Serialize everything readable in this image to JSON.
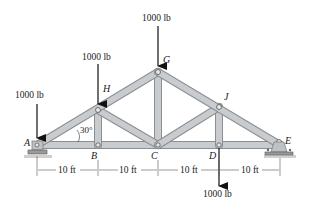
{
  "diagram": {
    "type": "roof truss",
    "joints": [
      {
        "id": "A",
        "label": "A",
        "x": 37,
        "y": 145
      },
      {
        "id": "B",
        "label": "B",
        "x": 98,
        "y": 145
      },
      {
        "id": "C",
        "label": "C",
        "x": 158,
        "y": 145
      },
      {
        "id": "D",
        "label": "D",
        "x": 219,
        "y": 145
      },
      {
        "id": "E",
        "label": "E",
        "x": 280,
        "y": 145
      },
      {
        "id": "H",
        "label": "H",
        "x": 98,
        "y": 110
      },
      {
        "id": "G",
        "label": "G",
        "x": 158,
        "y": 72
      },
      {
        "id": "J",
        "label": "J",
        "x": 219,
        "y": 107
      }
    ],
    "members": [
      [
        "A",
        "B"
      ],
      [
        "B",
        "C"
      ],
      [
        "C",
        "D"
      ],
      [
        "D",
        "E"
      ],
      [
        "A",
        "H"
      ],
      [
        "H",
        "G"
      ],
      [
        "G",
        "J"
      ],
      [
        "J",
        "E"
      ],
      [
        "B",
        "H"
      ],
      [
        "H",
        "C"
      ],
      [
        "C",
        "G"
      ],
      [
        "C",
        "J"
      ],
      [
        "J",
        "D"
      ]
    ],
    "loads": [
      {
        "at": "A",
        "label": "1000 lb",
        "direction": "down"
      },
      {
        "at": "H",
        "label": "1000 lb",
        "direction": "down"
      },
      {
        "at": "G",
        "label": "1000 lb",
        "direction": "down"
      },
      {
        "at": "D",
        "label": "1000 lb",
        "direction": "down"
      }
    ],
    "angle": {
      "at": "A",
      "label": "30°"
    },
    "dimensions": [
      "10 ft",
      "10 ft",
      "10 ft",
      "10 ft"
    ],
    "supports": [
      {
        "at": "A",
        "type": "pin"
      },
      {
        "at": "E",
        "type": "rocker"
      }
    ],
    "colors": {
      "member_fill": "#c9cccf",
      "member_edge": "#8a8f94",
      "arrow": "#111111",
      "ground": "#b0b0b0"
    }
  }
}
